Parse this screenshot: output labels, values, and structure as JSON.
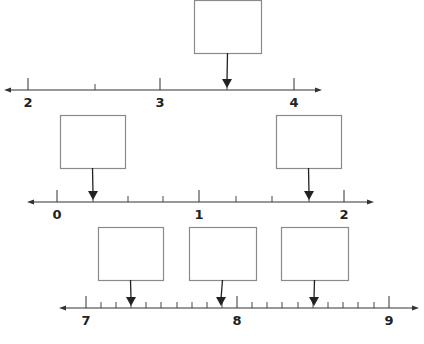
{
  "number_lines": [
    {
      "id": "line-1",
      "axis_y": 90,
      "x_start": 4,
      "x_end": 322,
      "labels": [
        {
          "value": "2",
          "x": 28
        },
        {
          "value": "3",
          "x": 160
        },
        {
          "value": "4",
          "x": 294
        }
      ],
      "major_ticks": [
        28,
        160,
        294
      ],
      "minor_ticks": [
        95,
        227
      ],
      "answer_boxes": [
        {
          "x": 194,
          "y": 0,
          "w": 67,
          "h": 53,
          "arrow_x": 227,
          "value": ""
        }
      ]
    },
    {
      "id": "line-2",
      "axis_y": 202,
      "x_start": 27,
      "x_end": 374,
      "labels": [
        {
          "value": "0",
          "x": 57
        },
        {
          "value": "1",
          "x": 199
        },
        {
          "value": "2",
          "x": 344
        }
      ],
      "major_ticks": [
        57,
        199,
        344
      ],
      "minor_ticks": [
        93,
        128,
        163,
        236,
        272,
        309
      ],
      "answer_boxes": [
        {
          "x": 60,
          "y": 115,
          "w": 65,
          "h": 53,
          "arrow_x": 93,
          "value": ""
        },
        {
          "x": 276,
          "y": 115,
          "w": 65,
          "h": 53,
          "arrow_x": 309,
          "value": ""
        }
      ]
    },
    {
      "id": "line-3",
      "axis_y": 308,
      "x_start": 59,
      "x_end": 419,
      "labels": [
        {
          "value": "7",
          "x": 86
        },
        {
          "value": "8",
          "x": 237
        },
        {
          "value": "9",
          "x": 389
        }
      ],
      "major_ticks": [
        86,
        237,
        389
      ],
      "minor_ticks": [
        101,
        116,
        131,
        146,
        161,
        177,
        192,
        207,
        222,
        252,
        267,
        282,
        298,
        313,
        328,
        343,
        358,
        374
      ],
      "answer_boxes": [
        {
          "x": 98,
          "y": 227,
          "w": 65,
          "h": 53,
          "arrow_x": 131,
          "value": ""
        },
        {
          "x": 189,
          "y": 227,
          "w": 67,
          "h": 53,
          "arrow_x": 221,
          "value": ""
        },
        {
          "x": 281,
          "y": 227,
          "w": 67,
          "h": 53,
          "arrow_x": 314,
          "value": ""
        }
      ]
    }
  ],
  "colors": {
    "line": "#333333",
    "box_border": "#8a8a8a",
    "arrow": "#222222"
  }
}
